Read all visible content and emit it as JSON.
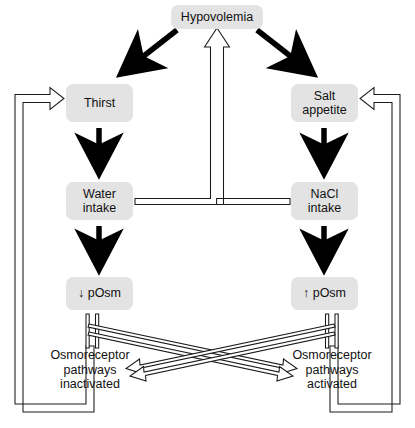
{
  "figure": {
    "type": "flow-diagram"
  },
  "colors": {
    "node_fill": "#e3e3e3",
    "text": "#111111",
    "thick_arrow": "#000000",
    "outline_arrow_stroke": "#1a1a1a",
    "outline_arrow_fill": "#ffffff",
    "background": "#ffffff"
  },
  "nodes": {
    "hypovolemia": {
      "label": "Hypovolemia",
      "x": 171,
      "y": 5,
      "w": 92,
      "h": 24
    },
    "thirst": {
      "label": "Thirst",
      "x": 66,
      "y": 84,
      "w": 67,
      "h": 38
    },
    "salt_appetite": {
      "label": "Salt\nappetite",
      "x": 291,
      "y": 84,
      "w": 67,
      "h": 38
    },
    "water_intake": {
      "label": "Water\nintake",
      "x": 66,
      "y": 182,
      "w": 67,
      "h": 38
    },
    "nacl_intake": {
      "label": "NaCl\nintake",
      "x": 291,
      "y": 182,
      "w": 67,
      "h": 38
    },
    "low_posm": {
      "label": "↓ pOsm",
      "x": 66,
      "y": 277,
      "w": 67,
      "h": 33
    },
    "high_posm": {
      "label": "↑ pOsm",
      "x": 291,
      "y": 277,
      "w": 67,
      "h": 33
    },
    "osmo_inactivated": {
      "label": "Osmoreceptor\npathways\ninactivated",
      "x": 30,
      "y": 348,
      "w": 120,
      "h": 44
    },
    "osmo_activated": {
      "label": "Osmoreceptor\npathways\nactivated",
      "x": 272,
      "y": 348,
      "w": 120,
      "h": 44
    }
  },
  "edges": [
    {
      "name": "hypovolemia-to-thirst",
      "style": "thick-solid",
      "from": "hypovolemia",
      "to": "thirst"
    },
    {
      "name": "hypovolemia-to-salt-appetite",
      "style": "thick-solid",
      "from": "hypovolemia",
      "to": "salt_appetite"
    },
    {
      "name": "thirst-to-water-intake",
      "style": "thick-solid",
      "from": "thirst",
      "to": "water_intake"
    },
    {
      "name": "salt-appetite-to-nacl-intake",
      "style": "thick-solid",
      "from": "salt_appetite",
      "to": "nacl_intake"
    },
    {
      "name": "water-intake-to-low-posm",
      "style": "thick-solid",
      "from": "water_intake",
      "to": "low_posm"
    },
    {
      "name": "nacl-intake-to-high-posm",
      "style": "thick-solid",
      "from": "nacl_intake",
      "to": "high_posm"
    },
    {
      "name": "intake-tee-to-hypovolemia",
      "style": "outline-open",
      "from": "water_intake+nacl_intake",
      "to": "hypovolemia"
    },
    {
      "name": "low-posm-to-osmo-activated",
      "style": "outline-open",
      "from": "low_posm",
      "to": "osmo_activated"
    },
    {
      "name": "high-posm-to-osmo-inactivated",
      "style": "outline-open",
      "from": "high_posm",
      "to": "osmo_inactivated"
    },
    {
      "name": "osmo-inactivated-to-thirst",
      "style": "outline-open",
      "from": "osmo_inactivated",
      "to": "thirst"
    },
    {
      "name": "osmo-activated-to-salt-appetite",
      "style": "outline-open",
      "from": "osmo_activated",
      "to": "salt_appetite"
    }
  ]
}
